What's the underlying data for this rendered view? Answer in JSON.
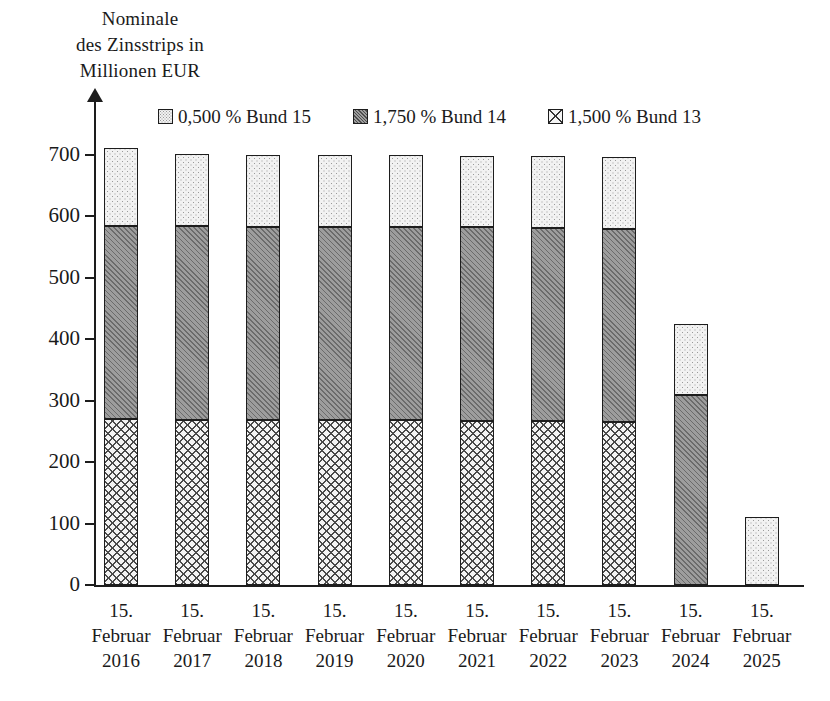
{
  "chart_data": {
    "type": "bar",
    "stacked": true,
    "title": "",
    "ylabel": "Nominale des Zinsstrips in Millionen EUR",
    "ylabel_lines": [
      "Nominale",
      "des Zinsstrips in",
      "Millionen EUR"
    ],
    "xlabel": "",
    "ylim": [
      0,
      700
    ],
    "yticks": [
      0,
      100,
      200,
      300,
      400,
      500,
      600,
      700
    ],
    "ytick_labels": [
      "0",
      "100",
      "200",
      "300",
      "400",
      "500",
      "600",
      "700"
    ],
    "grid": false,
    "legend_position": "top",
    "categories": [
      "15. Februar 2016",
      "15. Februar 2017",
      "15. Februar 2018",
      "15. Februar 2019",
      "15. Februar 2020",
      "15. Februar 2021",
      "15. Februar 2022",
      "15. Februar 2023",
      "15. Februar 2024",
      "15. Februar 2025"
    ],
    "category_lines": [
      [
        "15.",
        "Februar",
        "2016"
      ],
      [
        "15.",
        "Februar",
        "2017"
      ],
      [
        "15.",
        "Februar",
        "2018"
      ],
      [
        "15.",
        "Februar",
        "2019"
      ],
      [
        "15.",
        "Februar",
        "2020"
      ],
      [
        "15.",
        "Februar",
        "2021"
      ],
      [
        "15.",
        "Februar",
        "2022"
      ],
      [
        "15.",
        "Februar",
        "2023"
      ],
      [
        "15.",
        "Februar",
        "2024"
      ],
      [
        "15.",
        "Februar",
        "2025"
      ]
    ],
    "series": [
      {
        "name": "1,500 % Bund 13",
        "pattern": "cross-hatch",
        "stack_order": 0,
        "values": [
          270,
          268,
          268,
          268,
          268,
          267,
          267,
          266,
          0,
          0
        ]
      },
      {
        "name": "1,750 % Bund 14",
        "pattern": "diagonal-hatch",
        "stack_order": 1,
        "values": [
          315,
          316,
          315,
          315,
          315,
          315,
          314,
          314,
          310,
          0
        ]
      },
      {
        "name": "0,500 % Bund 15",
        "pattern": "dotted",
        "stack_order": 2,
        "values": [
          127,
          117,
          117,
          117,
          117,
          117,
          117,
          117,
          115,
          110
        ]
      }
    ],
    "totals": [
      712,
      701,
      700,
      700,
      700,
      699,
      698,
      697,
      425,
      110
    ]
  },
  "legend": {
    "items": [
      {
        "label": "0,500 % Bund 15",
        "swatch": "dotted"
      },
      {
        "label": "1,750 % Bund 14",
        "swatch": "diagonal-hatch"
      },
      {
        "label": "1,500 % Bund 13",
        "swatch": "cross-hatch"
      }
    ]
  },
  "colors": {
    "axis": "#1d1d1d",
    "text": "#1a1a1a",
    "dotted_fill": "#f2f2f2",
    "diagonal_fill": "#9d9d9d",
    "cross_fill": "#f4f4f4"
  }
}
